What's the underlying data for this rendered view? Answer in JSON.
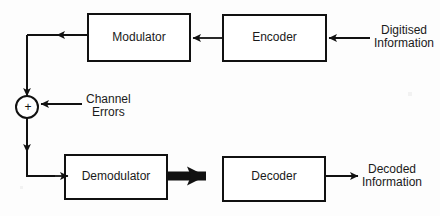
{
  "diagram": {
    "stroke_color": "#111111",
    "background_color": "#fdfdfd",
    "blocks": [
      {
        "id": "modulator",
        "label": "Modulator",
        "x": 88,
        "y": 14,
        "w": 102,
        "h": 47
      },
      {
        "id": "encoder",
        "label": "Encoder",
        "x": 223,
        "y": 15,
        "w": 103,
        "h": 46
      },
      {
        "id": "demodulator",
        "label": "Demodulator",
        "x": 65,
        "y": 155,
        "w": 102,
        "h": 44
      },
      {
        "id": "decoder",
        "label": "Decoder",
        "x": 223,
        "y": 157,
        "w": 102,
        "h": 44
      }
    ],
    "summing_junction": {
      "id": "summing-junction",
      "symbol": "+",
      "cx": 27,
      "cy": 107,
      "r": 11
    },
    "labels": [
      {
        "id": "digitised-information",
        "lines": [
          "Digitised",
          "Information"
        ],
        "x": 374,
        "y": 24
      },
      {
        "id": "channel-errors",
        "lines": [
          "Channel",
          "Errors"
        ],
        "x": 86,
        "y": 93
      },
      {
        "id": "decoded-information",
        "lines": [
          "Decoded",
          "Information"
        ],
        "x": 362,
        "y": 163
      }
    ],
    "connections": [
      {
        "id": "input-to-encoder",
        "from": "Digitised Information",
        "to": "Encoder",
        "style": "thin-arrow"
      },
      {
        "id": "encoder-to-modulator",
        "from": "Encoder",
        "to": "Modulator",
        "style": "thin-arrow"
      },
      {
        "id": "modulator-to-sum",
        "from": "Modulator",
        "to": "Summing junction",
        "style": "thin-arrow"
      },
      {
        "id": "channel-errors-to-sum",
        "from": "Channel Errors",
        "to": "Summing junction",
        "style": "thin-arrow"
      },
      {
        "id": "sum-to-demodulator",
        "from": "Summing junction",
        "to": "Demodulator",
        "style": "thin-arrow"
      },
      {
        "id": "demodulator-to-decoder",
        "from": "Demodulator",
        "to": "Decoder",
        "style": "thick-arrow"
      },
      {
        "id": "decoder-to-output",
        "from": "Decoder",
        "to": "Decoded Information",
        "style": "thin-arrow"
      }
    ]
  }
}
